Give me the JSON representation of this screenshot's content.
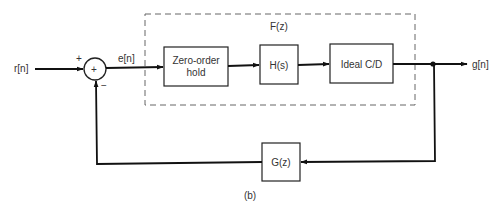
{
  "diagram": {
    "caption": "(b)",
    "input_label": "r[n]",
    "error_label": "e[n]",
    "output_label": "g[n]",
    "summing_junction": {
      "symbol": "+",
      "plus_sign": "+",
      "minus_sign": "−"
    },
    "group": {
      "label": "F(z)"
    },
    "blocks": [
      {
        "id": "zoh",
        "line1": "Zero-order",
        "line2": "hold"
      },
      {
        "id": "hs",
        "label": "H(s)"
      },
      {
        "id": "cd",
        "label": "Ideal C/D"
      },
      {
        "id": "gz",
        "label": "G(z)"
      }
    ]
  }
}
